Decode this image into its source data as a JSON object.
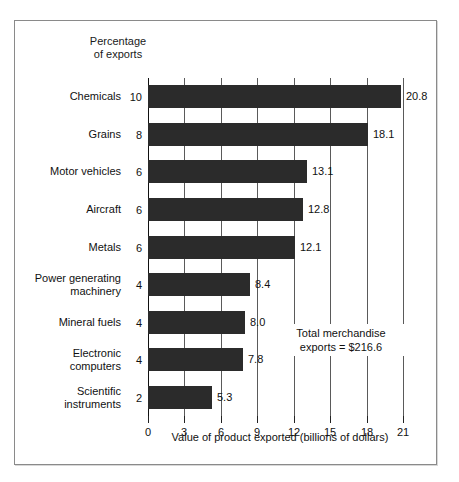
{
  "figure": {
    "percentage_header_line1": "Percentage",
    "percentage_header_line2": "of exports",
    "annotation_line1": "Total merchandise",
    "annotation_line2": "exports  =  $216.6",
    "axis_title": "Value of product exported (billions of dollars)"
  },
  "chart_data": {
    "type": "bar",
    "orientation": "horizontal",
    "title": "",
    "subtitle": "",
    "xlabel": "Value of product exported (billions of dollars)",
    "ylabel": "",
    "xlim": [
      0,
      21
    ],
    "xticks": [
      0,
      3,
      6,
      9,
      12,
      15,
      18,
      21
    ],
    "xtick_labels": [
      "0",
      "3",
      "6",
      "9",
      "12",
      "15",
      "18",
      "21"
    ],
    "grid": true,
    "grid_axis": "x",
    "legend": false,
    "bar_color": "#2b2b2b",
    "categories": [
      "Chemicals",
      "Grains",
      "Motor vehicles",
      "Aircraft",
      "Metals",
      "Power generating\nmachinery",
      "Mineral fuels",
      "Electronic\ncomputers",
      "Scientific\ninstruments"
    ],
    "values": [
      20.8,
      18.1,
      13.1,
      12.8,
      12.1,
      8.4,
      8.0,
      7.8,
      5.3
    ],
    "value_labels": [
      "20.8",
      "18.1",
      "13.1",
      "12.8",
      "12.1",
      "8.4",
      "8.0",
      "7.8",
      "5.3"
    ],
    "secondary_series": {
      "name": "Percentage of exports",
      "values": [
        10,
        8,
        6,
        6,
        6,
        4,
        4,
        4,
        2
      ],
      "labels": [
        "10",
        "8",
        "6",
        "6",
        "6",
        "4",
        "4",
        "4",
        "2"
      ]
    },
    "annotations": [
      {
        "text": "Total merchandise exports  =  $216.6",
        "total_merchandise_exports": 216.6
      }
    ]
  }
}
